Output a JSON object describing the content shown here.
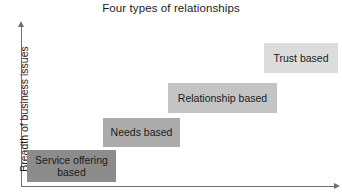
{
  "chart": {
    "title": "Four types of relationships",
    "y_axis_label": "Breadth of business issues",
    "x_axis_label": ""
  },
  "chart_data": {
    "type": "bar",
    "title": "Four types of relationships",
    "xlabel": "",
    "ylabel": "Breadth of business issues",
    "grid": false,
    "legend": "none",
    "note": "Ascending staircase of four labelled blocks; each successive block is higher and lighter in shade.",
    "categories": [
      "Service offering based",
      "Needs based",
      "Relationship based",
      "Trust based"
    ],
    "values": [
      1,
      2,
      3,
      4
    ],
    "steps": [
      {
        "label": "Service offering based",
        "label_lines": [
          "Service offering",
          "based"
        ],
        "level": 1,
        "color": "#8c8c8c",
        "x": 27,
        "y": 150,
        "width": 89,
        "height": 32
      },
      {
        "label": "Needs based",
        "label_lines": [
          "Needs based"
        ],
        "level": 2,
        "color": "#ababab",
        "x": 103,
        "y": 118,
        "width": 77,
        "height": 29
      },
      {
        "label": "Relationship based",
        "label_lines": [
          "Relationship based"
        ],
        "level": 3,
        "color": "#c4c4c4",
        "x": 168,
        "y": 83,
        "width": 109,
        "height": 30
      },
      {
        "label": "Trust based",
        "label_lines": [
          "Trust based"
        ],
        "level": 4,
        "color": "#dcdcdc",
        "x": 264,
        "y": 43,
        "width": 74,
        "height": 30
      }
    ],
    "axis_color": "#6f6f6f",
    "background": "#ffffff"
  }
}
